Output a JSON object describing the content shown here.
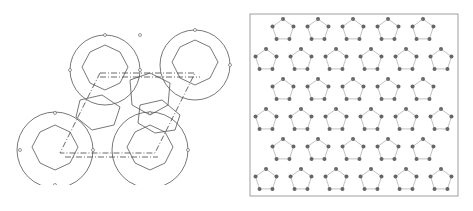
{
  "figure": {
    "left_panel": {
      "description": "Packing of truncated octahedra (cage polyhedra) with dash-dot unit cell outline",
      "stroke_color": "#555555"
    },
    "right_panel": {
      "description": "2D projection of atomic network with grey atoms in a square frame",
      "atom_color": "#666666",
      "frame_color": "#888888"
    },
    "caption": ""
  }
}
